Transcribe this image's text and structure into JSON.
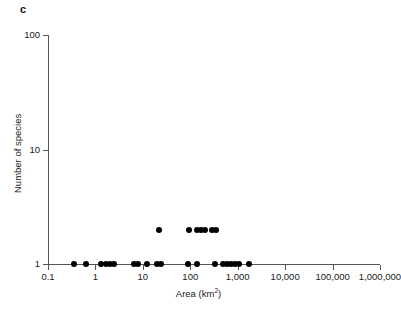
{
  "panel": {
    "label": "c"
  },
  "chart_data": {
    "type": "scatter",
    "title": "",
    "xlabel": "Area (km2)",
    "xlabel_base": "Area (km",
    "xlabel_sup": "2",
    "xlabel_close": ")",
    "ylabel": "Number of species",
    "xscale": "log",
    "yscale": "log",
    "xlim": [
      0.1,
      1000000
    ],
    "ylim": [
      1,
      100
    ],
    "grid": false,
    "legend": null,
    "xtick_labels": [
      "0.1",
      "1",
      "10",
      "100",
      "1,000",
      "10,000",
      "100,000",
      "1,000,000"
    ],
    "xtick_values": [
      0.1,
      1,
      10,
      100,
      1000,
      10000,
      100000,
      1000000
    ],
    "ytick_labels": [
      "1",
      "10",
      "100"
    ],
    "ytick_values": [
      1,
      10,
      100
    ],
    "points": [
      {
        "x": 0.35,
        "y": 1
      },
      {
        "x": 0.62,
        "y": 1
      },
      {
        "x": 1.3,
        "y": 1
      },
      {
        "x": 1.65,
        "y": 1
      },
      {
        "x": 2.0,
        "y": 1
      },
      {
        "x": 2.5,
        "y": 1
      },
      {
        "x": 6.6,
        "y": 1
      },
      {
        "x": 8.0,
        "y": 1
      },
      {
        "x": 12.0,
        "y": 1
      },
      {
        "x": 20.0,
        "y": 1
      },
      {
        "x": 24.0,
        "y": 1
      },
      {
        "x": 90.0,
        "y": 1
      },
      {
        "x": 140.0,
        "y": 1
      },
      {
        "x": 330.0,
        "y": 1
      },
      {
        "x": 480.0,
        "y": 1
      },
      {
        "x": 600.0,
        "y": 1
      },
      {
        "x": 720.0,
        "y": 1
      },
      {
        "x": 880.0,
        "y": 1
      },
      {
        "x": 1050.0,
        "y": 1
      },
      {
        "x": 1750.0,
        "y": 1
      },
      {
        "x": 22.0,
        "y": 2
      },
      {
        "x": 95.0,
        "y": 2
      },
      {
        "x": 140.0,
        "y": 2
      },
      {
        "x": 170.0,
        "y": 2
      },
      {
        "x": 200.0,
        "y": 2
      },
      {
        "x": 290.0,
        "y": 2
      },
      {
        "x": 350.0,
        "y": 2
      }
    ]
  }
}
